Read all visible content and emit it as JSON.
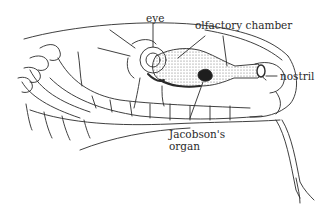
{
  "diagram": {
    "labels": [
      {
        "id": "eye",
        "text": "eye"
      },
      {
        "id": "olfactory_chamber",
        "text": "olfactory chamber"
      },
      {
        "id": "nostril",
        "text": "nostril"
      },
      {
        "id": "jacobsons_organ_line1",
        "text": "Jacobson's"
      },
      {
        "id": "jacobsons_organ_line2",
        "text": "organ"
      }
    ],
    "colors": {
      "line": "#2a2a2a",
      "background": "#ffffff",
      "stipple": "#6a6a6a"
    }
  }
}
